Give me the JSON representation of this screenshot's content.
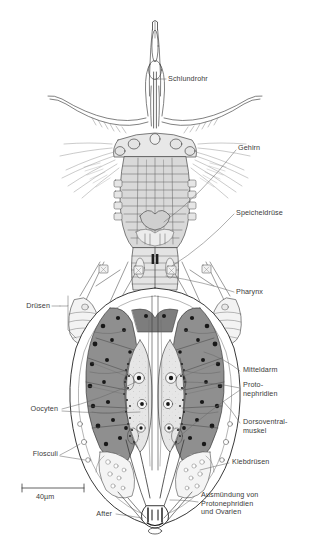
{
  "figure": {
    "type": "anatomical-diagram",
    "language": "German",
    "scale_bar": {
      "value": "40",
      "unit": "µm",
      "text": "40µm",
      "length_px": 62
    },
    "colors": {
      "ink": "#2b2b2b",
      "label_text": "#3a3a3a",
      "leader_line": "#555555",
      "midgut_fill": "#8d8d8d",
      "oocyte_fill": "#e2e2e2",
      "body_fill": "#ffffff",
      "corona_fill": "#d8d8d8",
      "gland_fill": "#f0f0f0",
      "nucleus": "#1a1a1a"
    }
  },
  "labels": [
    {
      "id": "schlundrohr",
      "text": "Schlundrohr",
      "side": "right",
      "x": 168,
      "y": 75,
      "lines": [
        "Schlundrohr"
      ]
    },
    {
      "id": "gehirn",
      "text": "Gehirn",
      "side": "right",
      "x": 238,
      "y": 147,
      "lines": [
        "Gehirn"
      ]
    },
    {
      "id": "speicheldruese",
      "text": "Speicheldrüse",
      "side": "right",
      "x": 236,
      "y": 211,
      "lines": [
        "Speicheldrüse"
      ]
    },
    {
      "id": "pharynx",
      "text": "Pharynx",
      "side": "right",
      "x": 236,
      "y": 289,
      "lines": [
        "Pharynx"
      ]
    },
    {
      "id": "druesen",
      "text": "Drüsen",
      "side": "left",
      "x": 27,
      "y": 302,
      "lines": [
        "Drüsen"
      ]
    },
    {
      "id": "mitteldarm",
      "text": "Mitteldarm",
      "side": "right",
      "x": 243,
      "y": 368,
      "lines": [
        "Mitteldarm"
      ]
    },
    {
      "id": "protonephridien",
      "text": "Proto-\nnephridien",
      "side": "right",
      "x": 243,
      "y": 383,
      "lines": [
        "Proto-",
        "nephridien"
      ]
    },
    {
      "id": "oocyten",
      "text": "Oocyten",
      "side": "left",
      "x": 20,
      "y": 406,
      "lines": [
        "Oocyten"
      ]
    },
    {
      "id": "dorsoventralmuskel",
      "text": "Dorsoventral-\nmuskel",
      "side": "right",
      "x": 243,
      "y": 420,
      "lines": [
        "Dorsoventral-",
        "muskel"
      ]
    },
    {
      "id": "flosculi",
      "text": "Flosculi",
      "side": "left",
      "x": 33,
      "y": 451,
      "lines": [
        "Flosculi"
      ]
    },
    {
      "id": "klebdruesen",
      "text": "Klebdrüsen",
      "side": "right",
      "x": 232,
      "y": 460,
      "lines": [
        "Klebdrüsen"
      ]
    },
    {
      "id": "ausmuendung",
      "text": "Ausmündung von\nProtonephridien\nund Ovarien",
      "side": "right",
      "x": 201,
      "y": 494,
      "lines": [
        "Ausmündung von",
        "Protonephridien",
        "und Ovarien"
      ]
    },
    {
      "id": "after",
      "text": "After",
      "side": "left",
      "x": 94,
      "y": 511,
      "lines": [
        "After"
      ]
    }
  ],
  "scale": {
    "text": "40µm",
    "x": 36,
    "y": 495
  }
}
